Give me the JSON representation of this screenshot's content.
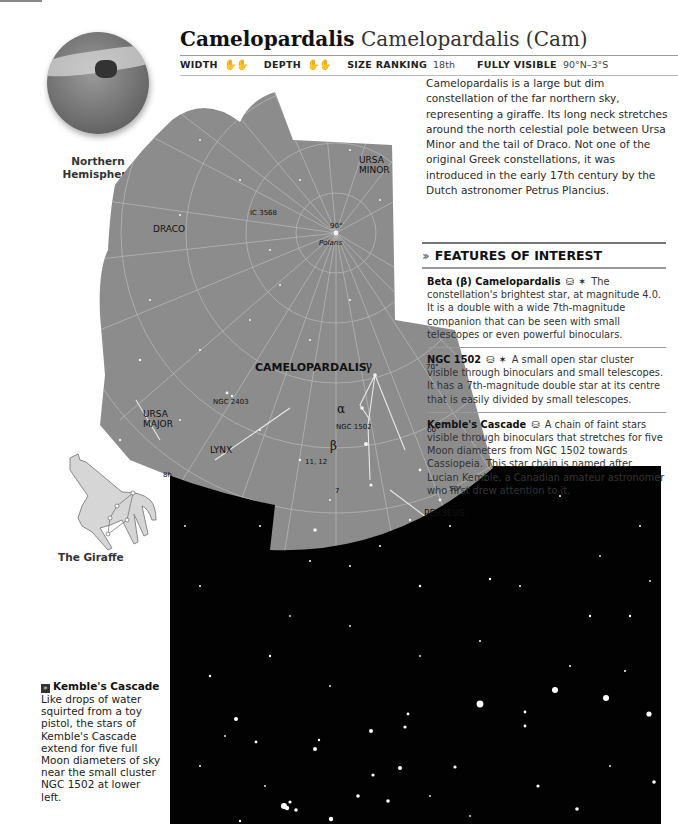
{
  "page_header": {
    "text": "174 STAR MAPS"
  },
  "title": {
    "bold": "Camelopardalis",
    "light": "Camelopardalis (Cam)"
  },
  "stats": {
    "width_label": "WIDTH",
    "width_value_icon": "hand-span-icons",
    "depth_label": "DEPTH",
    "depth_value_icon": "hand-span-icons",
    "size_ranking_label": "SIZE RANKING",
    "size_ranking_value": "18th",
    "fully_visible_label": "FULLY VISIBLE",
    "fully_visible_value": "90°N–3°S"
  },
  "locator": {
    "caption_line1": "Northern",
    "caption_line2": "Hemisphere"
  },
  "intro": "Camelopardalis is a large but dim constellation of the far northern sky, representing a giraffe. Its long neck stretches around the north celestial pole between Ursa Minor and the tail of Draco. Not one of the original Greek constellations, it was introduced in the early 17th century by the Dutch astronomer Petrus Plancius.",
  "features": {
    "title": "FEATURES OF INTEREST",
    "items": [
      {
        "name": "Beta (β) Camelopardalis",
        "icons": "binoculars-icon telescope-icon",
        "text": "The constellation's brightest star, at magnitude 4.0. It is a double with a wide 7th-magnitude companion that can be seen with small telescopes or even powerful binoculars."
      },
      {
        "name": "NGC 1502",
        "icons": "binoculars-icon telescope-icon",
        "text": "A small open star cluster visible through binoculars and small telescopes. It has a 7th-magnitude double star at its centre that is easily divided by small telescopes."
      },
      {
        "name": "Kemble's Cascade",
        "icons": "binoculars-icon",
        "text": "A chain of faint stars visible through binoculars that stretches for five Moon diameters from NGC 1502 towards Cassiopeia. This star chain is named after Lucian Kemble, a Canadian amateur astronomer who first drew attention to it."
      }
    ],
    "binoculars_glyph": "⌓",
    "telescope_glyph": "⚲"
  },
  "map": {
    "labels": {
      "ursa_minor_1": "URSA",
      "ursa_minor_2": "MINOR",
      "draco": "DRACO",
      "ic3568": "IC 3568",
      "deg90": "90°",
      "polaris": "Polaris",
      "camelopardalis": "CAMELOPARDALIS",
      "gamma": "γ",
      "alpha": "α",
      "beta": "β",
      "deg70": "70°",
      "deg60": "60°",
      "deg50": "50°",
      "ngc2403": "NGC 2403",
      "ngc1502": "NGC 1502",
      "ursa_major_1": "URSA",
      "ursa_major_2": "MAJOR",
      "lynx": "LYNX",
      "num1112": "11, 12",
      "num7": "7",
      "h8": "8h",
      "h7": "7h",
      "perseus": "PERSEUS"
    },
    "colors": {
      "sky": "#8a8a8a",
      "grid": "#b8b8b8",
      "lines": "#e6e6e6"
    }
  },
  "giraffe": {
    "caption": "The Giraffe"
  },
  "photo_caption": {
    "icon": "»",
    "title": "Kemble's Cascade",
    "text": "Like drops of water squirted from a toy pistol, the stars of Kemble's Cascade extend for five full Moon diameters of sky near the small cluster NGC 1502 at lower left."
  }
}
